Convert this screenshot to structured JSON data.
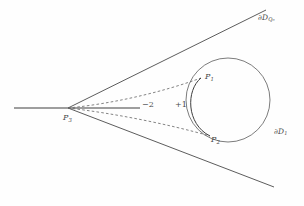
{
  "figure": {
    "background_color": "#fefefe",
    "stroke_color": "#4a4a4a",
    "labels": {
      "boundary_q0": {
        "base": "∂D",
        "sub": "Q₀",
        "name": "boundary-of-disc-Q0"
      },
      "boundary_d1": {
        "base": "∂D",
        "sub": "1",
        "name": "boundary-of-disc-D1"
      },
      "point_p1": {
        "base": "P",
        "sub": "1"
      },
      "point_p2": {
        "base": "P",
        "sub": "2"
      },
      "point_p3": {
        "base": "P",
        "sub": "3"
      },
      "multiplicity_minus_two": "−2",
      "multiplicity_plus_one": "+1"
    },
    "geometry": {
      "circle": {
        "cx": 228,
        "cy": 100,
        "r": 42
      },
      "external_point": {
        "x": 68,
        "y": 108
      },
      "tangency_point_upper": {
        "x": 201,
        "y": 78
      },
      "tangency_point_lower": {
        "x": 210,
        "y": 136
      },
      "tangent_upper_end": {
        "x": 266,
        "y": 10
      },
      "tangent_lower_end": {
        "x": 274,
        "y": 187
      },
      "axis_line": {
        "x1": 14,
        "y1": 108,
        "x2": 140,
        "y2": 108
      },
      "lens_arc_bulge_x": 188
    }
  }
}
